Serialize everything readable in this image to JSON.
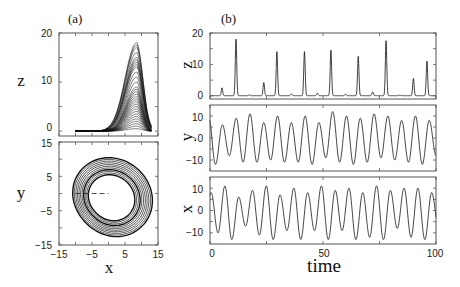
{
  "figure": {
    "panel_a_label": "(a)",
    "panel_b_label": "(b)"
  },
  "chart_data": [
    {
      "id": "a-top",
      "type": "line",
      "title": "(a)",
      "description": "Attractor projection: z vs x (many overlapping loops)",
      "xlabel": "",
      "ylabel": "z",
      "xlim": [
        -15,
        15
      ],
      "ylim": [
        -1,
        20
      ],
      "yticks": [
        0,
        10,
        20
      ],
      "ytick_labels": [
        "0",
        "10",
        "20"
      ],
      "xticks": [
        -15,
        -10,
        -5,
        0,
        5,
        10,
        15
      ],
      "x_range_of_curves": [
        -10,
        13
      ],
      "peak_x": 8.5,
      "loop_peaks_z": [
        0.5,
        1,
        1.5,
        2,
        2.5,
        3,
        3.5,
        4,
        4.5,
        5,
        5.5,
        6,
        6.5,
        7,
        7.5,
        8,
        8.5,
        9,
        10,
        11,
        12,
        13,
        13.5,
        14,
        14.5,
        15,
        16,
        17,
        17.5,
        18
      ]
    },
    {
      "id": "a-bottom",
      "type": "line",
      "description": "Attractor projection: y vs x (ring-shaped band)",
      "xlabel": "x",
      "ylabel": "y",
      "xlim": [
        -15,
        15
      ],
      "ylim": [
        -15,
        15
      ],
      "xticks": [
        -15,
        -5,
        5,
        15
      ],
      "xtick_labels": [
        "−15",
        "−5",
        "5",
        "15"
      ],
      "yticks": [
        -15,
        -5,
        5,
        15
      ],
      "ytick_labels": [
        "−15",
        "−5",
        "5",
        "15"
      ],
      "dashed_line": {
        "x0": -10,
        "x1": 0,
        "y": 0
      },
      "ring_center": [
        0.5,
        -1.5
      ],
      "ring_radii": [
        7,
        7.5,
        8,
        8.5,
        9,
        9.5,
        10,
        10.5,
        11,
        11.5,
        12
      ]
    },
    {
      "id": "b-z",
      "type": "line",
      "title": "(b)",
      "xlabel": "",
      "ylabel": "z",
      "xlim": [
        0,
        100
      ],
      "ylim": [
        -1,
        20
      ],
      "yticks": [
        0,
        10,
        20
      ],
      "ytick_labels": [
        "0",
        "10",
        "20"
      ],
      "peaks": [
        {
          "t": 5.3,
          "z": 2.5
        },
        {
          "t": 11.5,
          "z": 18
        },
        {
          "t": 17.5,
          "z": 0.3
        },
        {
          "t": 23.8,
          "z": 4.2
        },
        {
          "t": 29.6,
          "z": 14
        },
        {
          "t": 36,
          "z": 0.6
        },
        {
          "t": 41.8,
          "z": 14
        },
        {
          "t": 47.5,
          "z": 0.8
        },
        {
          "t": 53.5,
          "z": 14.5
        },
        {
          "t": 60,
          "z": 0.5
        },
        {
          "t": 65.6,
          "z": 12.5
        },
        {
          "t": 72,
          "z": 1.2
        },
        {
          "t": 77.9,
          "z": 17.5
        },
        {
          "t": 84,
          "z": 0.2
        },
        {
          "t": 90,
          "z": 5.5
        },
        {
          "t": 96,
          "z": 11
        }
      ]
    },
    {
      "id": "b-y",
      "type": "line",
      "xlabel": "",
      "ylabel": "y",
      "xlim": [
        0,
        100
      ],
      "ylim": [
        -15,
        15
      ],
      "yticks": [
        -10,
        0,
        10
      ],
      "ytick_labels": [
        "−10",
        "0",
        "10"
      ],
      "period": 6.1,
      "amplitudes": [
        10,
        12,
        6,
        8,
        9,
        11,
        11,
        11,
        7,
        10,
        10,
        11,
        7,
        11,
        10,
        12,
        7,
        9,
        12,
        11,
        10,
        12,
        9,
        11,
        11,
        9,
        10,
        10,
        8,
        11,
        10,
        12,
        8
      ]
    },
    {
      "id": "b-x",
      "type": "line",
      "xlabel": "time",
      "ylabel": "x",
      "xlim": [
        0,
        100
      ],
      "ylim": [
        -15,
        15
      ],
      "xticks": [
        0,
        50,
        100
      ],
      "xtick_labels": [
        "0",
        "50",
        "100"
      ],
      "yticks": [
        -10,
        0,
        10
      ],
      "ytick_labels": [
        "−10",
        "0",
        "10"
      ],
      "period": 6.1,
      "amplitudes": [
        -8,
        10,
        -11,
        13,
        -6,
        7,
        -9,
        11,
        -11,
        13,
        -7,
        9,
        -10,
        13,
        -8,
        9,
        -11,
        13,
        -9,
        9,
        -10,
        13,
        -8,
        12,
        -11,
        13,
        -9,
        8,
        -10,
        12,
        -10,
        13,
        -8
      ]
    }
  ],
  "labels": {
    "a_top_ylabel": "z",
    "a_bottom_ylabel": "y",
    "a_bottom_xlabel": "x",
    "b_z_ylabel": "z",
    "b_y_ylabel": "y",
    "b_x_ylabel": "x",
    "b_xlabel": "time",
    "a_top_yticks": [
      "0",
      "10",
      "20"
    ],
    "a_bottom_yticks": [
      "−15",
      "−5",
      "5",
      "15"
    ],
    "a_bottom_xticks": [
      "−15",
      "−5",
      "5",
      "15"
    ],
    "b_z_yticks": [
      "0",
      "10",
      "20"
    ],
    "b_y_yticks": [
      "−10",
      "0",
      "10"
    ],
    "b_x_yticks": [
      "−10",
      "0",
      "10"
    ],
    "b_xticks": [
      "0",
      "50",
      "100"
    ]
  }
}
